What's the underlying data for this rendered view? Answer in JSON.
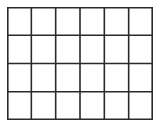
{
  "grid": {
    "columns": 6,
    "rows": 4,
    "line_color": "#2a2a2a",
    "line_width": 1.6,
    "background": "#ffffff"
  }
}
